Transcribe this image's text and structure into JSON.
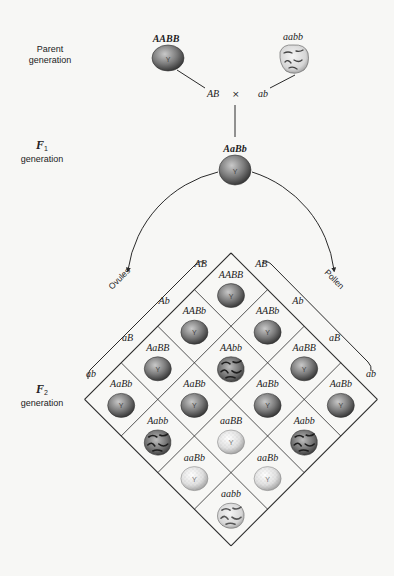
{
  "labels": {
    "parent_generation": [
      "Parent",
      "generation"
    ],
    "f1": {
      "symbol": "F",
      "sub": "1",
      "word": "generation"
    },
    "f2": {
      "symbol": "F",
      "sub": "2",
      "word": "generation"
    },
    "ovules": "Ovules",
    "pollen": "Pollen",
    "cross_symbol": "×"
  },
  "parents": [
    {
      "genotype": "AABB",
      "gamete": "AB",
      "phenotype": "yellow-round"
    },
    {
      "genotype": "aabb",
      "gamete": "ab",
      "phenotype": "green-wrinkled"
    }
  ],
  "f1": {
    "genotype": "AaBb",
    "phenotype": "yellow-round"
  },
  "punnett": {
    "ovule_gametes": [
      "AB",
      "Ab",
      "aB",
      "ab"
    ],
    "pollen_gametes": [
      "AB",
      "Ab",
      "aB",
      "ab"
    ],
    "cells": [
      [
        "AABB",
        "AABb",
        "AaBB",
        "AaBb"
      ],
      [
        "AABb",
        "AAbb",
        "AaBb",
        "Aabb"
      ],
      [
        "AaBB",
        "AaBb",
        "aaBB",
        "aaBb"
      ],
      [
        "AaBb",
        "Aabb",
        "aaBb",
        "aabb"
      ]
    ]
  },
  "seed_symbol": "Y",
  "colors": {
    "line": "#2a2a2a",
    "background": "#f7f7f5",
    "yellow_seed_dark": "#3a3a3a",
    "yellow_seed_light": "#bdbdbd",
    "green_seed_dark": "#9a9a9a",
    "green_seed_light": "#f2f2f2"
  }
}
